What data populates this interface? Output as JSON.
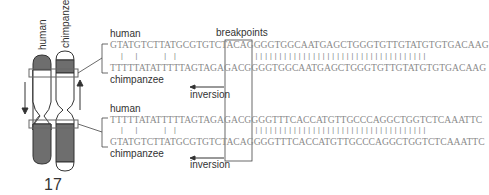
{
  "chromosome": {
    "number": "17",
    "labels": {
      "human": "human",
      "chimpanzee": "chimpanzee"
    }
  },
  "breakpoints_label": "breakpoints",
  "blocks": [
    {
      "top_label": "human",
      "top_seq": "GTATGTCTTATGCGTGTCTACAGGGGTGGCAATGAGCTGGGTGTTGTATGTGTGACAAG",
      "match": "  |  |     | |                ||||||||||||||||||||||||||||||||||||",
      "bottom_seq": "TTTTTATATTTTTAGTAGAGACGGGGTGGCAATGAGCTGGGTGTTGTATGTGTGACAAG",
      "bottom_label": "chimpanzee",
      "inversion_label": "inversion"
    },
    {
      "top_label": "human",
      "top_seq": "TTTTTATATTTTTAGTAGAGACGGGGTTTCACCATGTTGCCCAGGCTGGTCTCAAATTC",
      "match": "  |  |     | |                ||||||||||||||||||||||||||||||||||||",
      "bottom_seq": "GTATGTCTTATGCGTGTCTACAGGGGTTTCACCATGTTGCCCAGGCTGGTCTCAAATTC",
      "bottom_label": "chimpanzee",
      "inversion_label": "inversion"
    }
  ],
  "colors": {
    "band_dark": "#6e6e6e",
    "outline": "#333333",
    "sequence": "#8a8a8a",
    "text": "#333333"
  }
}
